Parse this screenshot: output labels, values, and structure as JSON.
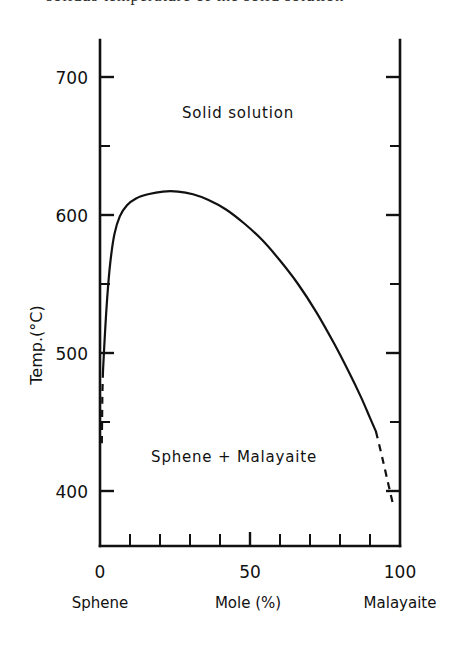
{
  "figure": {
    "cropped_caption": "solidus temperature of the solid solution",
    "background_color": "#ffffff",
    "ink_color": "#111111"
  },
  "chart_data": {
    "type": "line",
    "title": "",
    "subtitle": "",
    "xlabel": "Mole (%)",
    "ylabel": "Temp.(°C)",
    "xlim": [
      0,
      100
    ],
    "ylim": [
      370,
      720
    ],
    "grid": false,
    "legend": false,
    "legend_position": "none",
    "x_ticks_major": [
      0,
      50,
      100
    ],
    "x_tick_labels": [
      "0",
      "50",
      "100"
    ],
    "x_ticks_minor": [
      10,
      20,
      30,
      40,
      60,
      70,
      80,
      90
    ],
    "y_ticks_major": [
      400,
      500,
      600,
      700
    ],
    "y_tick_labels": [
      "400",
      "500",
      "600",
      "700"
    ],
    "y_ticks_minor": [
      450,
      550,
      650
    ],
    "x_end_label_left": "Sphene",
    "x_end_label_right": "Malayaite",
    "annotations": [
      {
        "text": "Solid solution",
        "x": 50,
        "y": 668,
        "region": "upper"
      },
      {
        "text": "Sphene + Malayaite",
        "x": 49,
        "y": 428,
        "region": "lower"
      }
    ],
    "series": [
      {
        "name": "Solvus (miscibility gap)",
        "style": "solid",
        "crest": {
          "x": 26,
          "y": 617
        },
        "points": [
          {
            "x": 1.0,
            "y": 487
          },
          {
            "x": 1.6,
            "y": 512
          },
          {
            "x": 2.4,
            "y": 540
          },
          {
            "x": 3.4,
            "y": 565
          },
          {
            "x": 4.8,
            "y": 586
          },
          {
            "x": 6.6,
            "y": 599
          },
          {
            "x": 9.0,
            "y": 607
          },
          {
            "x": 12.0,
            "y": 612
          },
          {
            "x": 16.0,
            "y": 615
          },
          {
            "x": 21.0,
            "y": 617
          },
          {
            "x": 26.0,
            "y": 617
          },
          {
            "x": 31.0,
            "y": 615
          },
          {
            "x": 36.0,
            "y": 611
          },
          {
            "x": 42.0,
            "y": 604
          },
          {
            "x": 48.0,
            "y": 594
          },
          {
            "x": 54.0,
            "y": 582
          },
          {
            "x": 60.0,
            "y": 567
          },
          {
            "x": 66.0,
            "y": 550
          },
          {
            "x": 72.0,
            "y": 530
          },
          {
            "x": 78.0,
            "y": 507
          },
          {
            "x": 83.0,
            "y": 486
          },
          {
            "x": 87.0,
            "y": 468
          },
          {
            "x": 90.0,
            "y": 453
          },
          {
            "x": 92.0,
            "y": 443
          }
        ]
      },
      {
        "name": "Solvus extrapolation (left, dashed)",
        "style": "dashed",
        "points": [
          {
            "x": 1.0,
            "y": 487
          },
          {
            "x": 0.8,
            "y": 470
          },
          {
            "x": 0.7,
            "y": 452
          },
          {
            "x": 0.6,
            "y": 434
          }
        ]
      },
      {
        "name": "Solvus extrapolation (right, dashed)",
        "style": "dashed",
        "points": [
          {
            "x": 92.0,
            "y": 443
          },
          {
            "x": 94.0,
            "y": 425
          },
          {
            "x": 96.0,
            "y": 406
          },
          {
            "x": 97.6,
            "y": 391
          }
        ]
      }
    ]
  }
}
